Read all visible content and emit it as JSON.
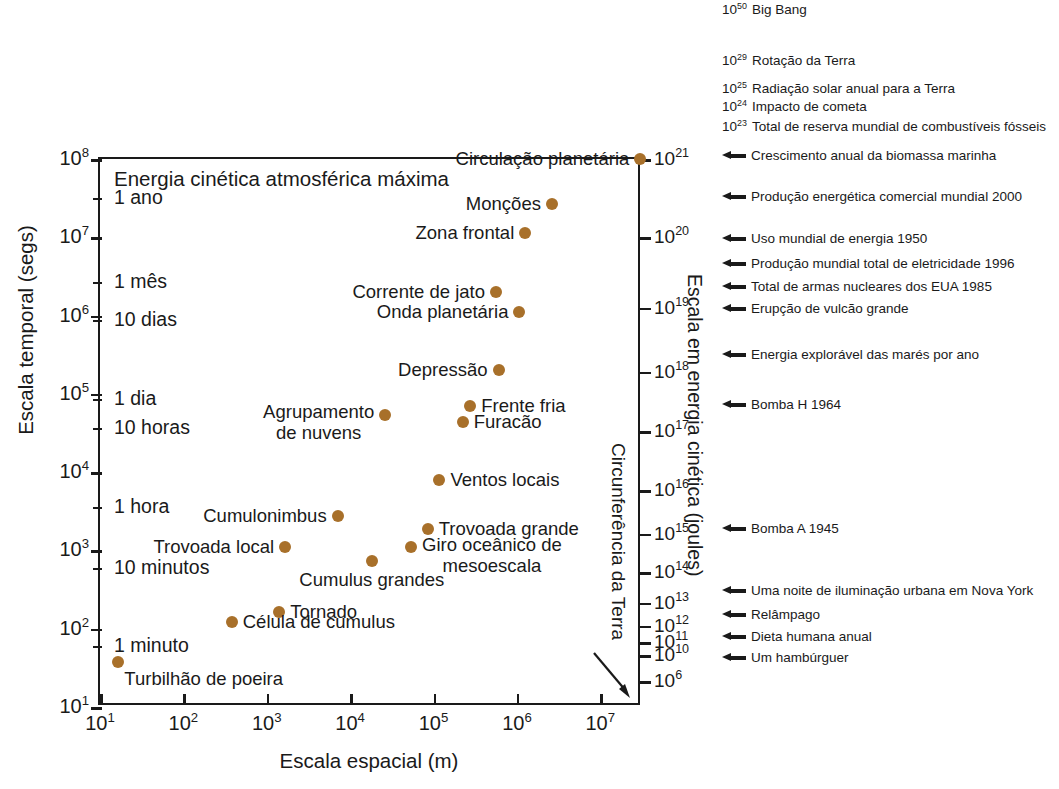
{
  "chart_data": {
    "type": "scatter",
    "title": "Energia cinética atmosférica máxima",
    "xlabel": "Escala espacial (m)",
    "ylabel": "Escala temporal (segs)",
    "y2label": "Escala em energia cinética (joules)",
    "xlim_exp": [
      1,
      7.5
    ],
    "ylim_exp": [
      1,
      8
    ],
    "grid": false,
    "legend": "none",
    "marker_color": "#a8702a",
    "x_ticks": [
      "10¹",
      "10²",
      "10³",
      "10⁴",
      "10⁵",
      "10⁶",
      "10⁷"
    ],
    "x_tick_exp": [
      1,
      2,
      3,
      4,
      5,
      6,
      7
    ],
    "y_ticks_major": [
      {
        "label_base": "10",
        "label_exp": "8",
        "exp": 8
      },
      {
        "label_base": "10",
        "label_exp": "7",
        "exp": 7
      },
      {
        "label_base": "10",
        "label_exp": "6",
        "exp": 6
      },
      {
        "label_base": "10",
        "label_exp": "5",
        "exp": 5
      },
      {
        "label_base": "10",
        "label_exp": "4",
        "exp": 4
      },
      {
        "label_base": "10",
        "label_exp": "3",
        "exp": 3
      },
      {
        "label_base": "10",
        "label_exp": "2",
        "exp": 2
      },
      {
        "label_base": "10",
        "label_exp": "1",
        "exp": 1
      }
    ],
    "y_time_markers": [
      {
        "label": "1 ano",
        "exp": 7.5
      },
      {
        "label": "1 mês",
        "exp": 6.43
      },
      {
        "label": "10 dias",
        "exp": 5.94
      },
      {
        "label": "1 dia",
        "exp": 4.94
      },
      {
        "label": "10 horas",
        "exp": 4.56
      },
      {
        "label": "1 hora",
        "exp": 3.56
      },
      {
        "label": "10 minutos",
        "exp": 2.78
      },
      {
        "label": "1 minuto",
        "exp": 1.78
      }
    ],
    "y2_ticks": [
      {
        "label_base": "10",
        "label_exp": "21",
        "exp": 8.0
      },
      {
        "label_base": "10",
        "label_exp": "20",
        "exp": 7.0
      },
      {
        "label_base": "10",
        "label_exp": "19",
        "exp": 6.1
      },
      {
        "label_base": "10",
        "label_exp": "18",
        "exp": 5.28
      },
      {
        "label_base": "10",
        "label_exp": "17",
        "exp": 4.52
      },
      {
        "label_base": "10",
        "label_exp": "16",
        "exp": 3.77
      },
      {
        "label_base": "10",
        "label_exp": "15",
        "exp": 3.21
      },
      {
        "label_base": "10",
        "label_exp": "14",
        "exp": 2.72
      },
      {
        "label_base": "10",
        "label_exp": "13",
        "exp": 2.33
      },
      {
        "label_base": "10",
        "label_exp": "12",
        "exp": 2.04
      },
      {
        "label_base": "10",
        "label_exp": "11",
        "exp": 1.83
      },
      {
        "label_base": "10",
        "label_exp": "10",
        "exp": 1.66
      },
      {
        "label_base": "10",
        "label_exp": "6",
        "exp": 1.33
      }
    ],
    "earth_circumference_label": "Circunferência da Terra",
    "points": [
      {
        "name": "Circulação planetária",
        "x_exp": 7.48,
        "y_exp": 8.0,
        "label_pos": "left"
      },
      {
        "name": "Monções",
        "x_exp": 6.42,
        "y_exp": 7.42,
        "label_pos": "left"
      },
      {
        "name": "Zona frontal",
        "x_exp": 6.1,
        "y_exp": 7.05,
        "label_pos": "left"
      },
      {
        "name": "Corrente de jato",
        "x_exp": 5.75,
        "y_exp": 6.3,
        "label_pos": "left"
      },
      {
        "name": "Onda planetária",
        "x_exp": 6.03,
        "y_exp": 6.05,
        "label_pos": "left"
      },
      {
        "name": "Depressão",
        "x_exp": 5.78,
        "y_exp": 5.3,
        "label_pos": "left"
      },
      {
        "name": "Frente fria",
        "x_exp": 5.44,
        "y_exp": 4.85,
        "label_pos": "right"
      },
      {
        "name": "Furacão",
        "x_exp": 5.35,
        "y_exp": 4.64,
        "label_pos": "right"
      },
      {
        "name": "Agrupamento\nde nuvens",
        "x_exp": 4.42,
        "y_exp": 4.73,
        "label_pos": "left-two"
      },
      {
        "name": "Ventos locais",
        "x_exp": 5.07,
        "y_exp": 3.9,
        "label_pos": "right"
      },
      {
        "name": "Trovoada grande",
        "x_exp": 4.93,
        "y_exp": 3.27,
        "label_pos": "right"
      },
      {
        "name": "Cumulonimbus",
        "x_exp": 3.85,
        "y_exp": 3.44,
        "label_pos": "left"
      },
      {
        "name": "Giro oceânico de\nmesoescala",
        "x_exp": 4.73,
        "y_exp": 3.04,
        "label_pos": "right-two"
      },
      {
        "name": "Trovoada local",
        "x_exp": 3.22,
        "y_exp": 3.05,
        "label_pos": "left"
      },
      {
        "name": "Cumulus grandes",
        "x_exp": 4.26,
        "y_exp": 2.87,
        "label_pos": "below"
      },
      {
        "name": "Tornado",
        "x_exp": 3.15,
        "y_exp": 2.21,
        "label_pos": "right"
      },
      {
        "name": "Célula de cumulus",
        "x_exp": 2.58,
        "y_exp": 2.08,
        "label_pos": "right"
      },
      {
        "name": "Turbilhão de poeira",
        "x_exp": 1.22,
        "y_exp": 1.58,
        "label_pos": "below-right"
      }
    ],
    "energy_annotations": [
      {
        "exponent": "50",
        "text": "Big Bang",
        "marker": "exponent",
        "top": 2
      },
      {
        "exponent": "29",
        "text": "Rotação da Terra",
        "marker": "exponent",
        "top": 53
      },
      {
        "exponent": "25",
        "text": "Radiação solar anual para a Terra",
        "marker": "exponent",
        "top": 81
      },
      {
        "exponent": "24",
        "text": "Impacto de cometa",
        "marker": "exponent",
        "top": 99
      },
      {
        "exponent": "23",
        "text": "Total de reserva mundial de combustíveis fósseis",
        "marker": "exponent",
        "top": 119
      },
      {
        "exponent": "",
        "text": "Crescimento anual da biomassa marinha",
        "marker": "arrow",
        "top": 148
      },
      {
        "exponent": "",
        "text": "Produção energética comercial mundial 2000",
        "marker": "arrow",
        "top": 189
      },
      {
        "exponent": "",
        "text": "Uso mundial de energia 1950",
        "marker": "arrow",
        "top": 231
      },
      {
        "exponent": "",
        "text": "Produção mundial total de eletricidade 1996",
        "marker": "arrow",
        "top": 256
      },
      {
        "exponent": "",
        "text": "Total de armas nucleares dos EUA 1985",
        "marker": "arrow",
        "top": 279
      },
      {
        "exponent": "",
        "text": "Erupção de vulcão grande",
        "marker": "arrow",
        "top": 301
      },
      {
        "exponent": "",
        "text": "Energia explorável das marés por ano",
        "marker": "arrow",
        "top": 347
      },
      {
        "exponent": "",
        "text": "Bomba H 1964",
        "marker": "arrow",
        "top": 397
      },
      {
        "exponent": "",
        "text": "Bomba A 1945",
        "marker": "arrow",
        "top": 521
      },
      {
        "exponent": "",
        "text": "Uma noite de iluminação urbana em Nova York",
        "marker": "arrow",
        "top": 583
      },
      {
        "exponent": "",
        "text": "Relâmpago",
        "marker": "arrow",
        "top": 607
      },
      {
        "exponent": "",
        "text": "Dieta humana anual",
        "marker": "arrow",
        "top": 629
      },
      {
        "exponent": "",
        "text": "Um hambúrguer",
        "marker": "arrow",
        "top": 650
      }
    ]
  }
}
